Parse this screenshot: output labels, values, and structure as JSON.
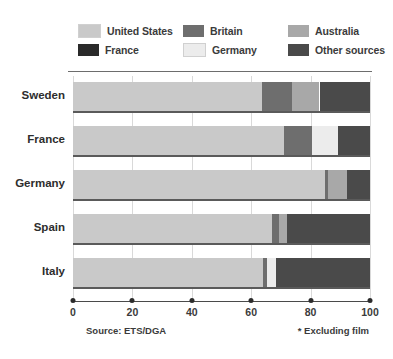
{
  "chart_data": {
    "type": "bar",
    "orientation": "horizontal",
    "stacked": true,
    "normalized_percent": true,
    "title": "",
    "xlabel": "",
    "ylabel": "",
    "xlim": [
      0,
      100
    ],
    "xticks": [
      0,
      20,
      40,
      60,
      80,
      100
    ],
    "xtick_labels": [
      "0",
      "20",
      "40",
      "60",
      "80",
      "100"
    ],
    "grid": true,
    "legend_position": "top",
    "categories": [
      "Sweden",
      "France",
      "Germany",
      "Spain",
      "Italy"
    ],
    "series": [
      {
        "name": "United States",
        "color": "#c9c9c9",
        "values": [
          63.6,
          71.0,
          85.0,
          67.0,
          64.0
        ]
      },
      {
        "name": "France",
        "color": "#2a2a2a",
        "values": [
          0,
          0,
          0,
          0,
          0
        ]
      },
      {
        "name": "Britain",
        "color": "#6e6e6e",
        "values": [
          10.1,
          9.5,
          0.9,
          2.4,
          1.2
        ]
      },
      {
        "name": "Germany",
        "color": "#ececec",
        "values": [
          0,
          8.8,
          0,
          0,
          3.0
        ]
      },
      {
        "name": "Australia",
        "color": "#a8a8a8",
        "values": [
          9.3,
          0,
          6.5,
          2.6,
          0
        ]
      },
      {
        "name": "Other sources",
        "color": "#4a4a4a",
        "values": [
          17.0,
          10.7,
          7.6,
          28.0,
          31.8
        ]
      }
    ],
    "annotations": {
      "source": "Source: ETS/DGA",
      "footnote": "* Excluding film"
    }
  },
  "legend": {
    "items": [
      {
        "label": "United States",
        "swatch_name": "legend-swatch-united-states",
        "color": "#c9c9c9"
      },
      {
        "label": "Britain",
        "swatch_name": "legend-swatch-britain",
        "color": "#6e6e6e"
      },
      {
        "label": "Australia",
        "swatch_name": "legend-swatch-australia",
        "color": "#a8a8a8"
      },
      {
        "label": "France",
        "swatch_name": "legend-swatch-france",
        "color": "#2a2a2a"
      },
      {
        "label": "Germany",
        "swatch_name": "legend-swatch-germany",
        "color": "#ececec"
      },
      {
        "label": "Other sources",
        "swatch_name": "legend-swatch-other-sources",
        "color": "#4a4a4a"
      }
    ]
  },
  "notes": {
    "source": "Source: ETS/DGA",
    "excluding": "* Excluding film"
  }
}
